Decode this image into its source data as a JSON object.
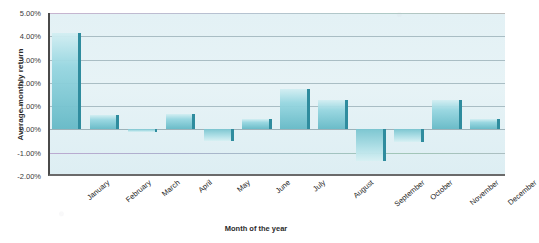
{
  "chart_data": {
    "type": "bar",
    "title": "",
    "xlabel": "Month of the year",
    "ylabel": "Average monthly return",
    "categories": [
      "January",
      "February",
      "March",
      "April",
      "May",
      "June",
      "July",
      "August",
      "September",
      "October",
      "November",
      "December"
    ],
    "values": [
      4.15,
      0.6,
      -0.1,
      0.65,
      -0.5,
      0.45,
      1.75,
      1.25,
      -1.35,
      -0.55,
      1.25,
      0.45
    ],
    "ylim": [
      -2.0,
      5.0
    ],
    "ytick_values": [
      5.0,
      4.0,
      3.0,
      2.0,
      1.0,
      0.0,
      -1.0,
      -2.0
    ],
    "ytick_labels": [
      "5.00%",
      "4.00%",
      "3.00%",
      "2.00%",
      "1.00%",
      "0.00%",
      "-1.00%",
      "-2.00%"
    ],
    "grid": true,
    "legend": "none",
    "series_name": "Average monthly return",
    "bar_color": "#6abac7",
    "bar_edge_color": "#2f8c9e",
    "plot_background": "#e3f1f5",
    "gridline_color": "#9fb4bb"
  }
}
